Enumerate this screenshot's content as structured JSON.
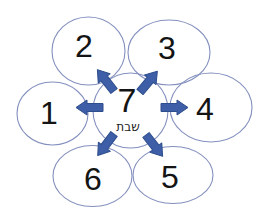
{
  "diagram": {
    "type": "hub-and-spoke",
    "center_circle": {
      "number": "7",
      "caption": "שבת"
    },
    "satellite_circles": [
      {
        "number": "1",
        "position": "left"
      },
      {
        "number": "2",
        "position": "top-left"
      },
      {
        "number": "3",
        "position": "top-right"
      },
      {
        "number": "4",
        "position": "right"
      },
      {
        "number": "5",
        "position": "bottom-right"
      },
      {
        "number": "6",
        "position": "bottom-left"
      }
    ],
    "arrows": [
      {
        "from": "7",
        "to": "1",
        "direction": "left"
      },
      {
        "from": "7",
        "to": "2",
        "direction": "up-left"
      },
      {
        "from": "7",
        "to": "3",
        "direction": "up-right"
      },
      {
        "from": "7",
        "to": "4",
        "direction": "right"
      },
      {
        "from": "7",
        "to": "5",
        "direction": "down-right"
      },
      {
        "from": "7",
        "to": "6",
        "direction": "down-left"
      }
    ],
    "colors": {
      "arrow_fill": "#3e5fa8",
      "arrow_stroke": "#2e4d8c",
      "circle_stroke": "#8490be",
      "number_color": "#141414",
      "background": "#ffffff"
    }
  }
}
